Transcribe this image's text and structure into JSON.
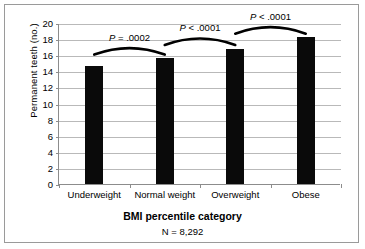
{
  "chart_data": {
    "type": "bar",
    "title": "",
    "xlabel": "BMI percentile category",
    "ylabel": "Permanent teeth (no.)",
    "subtitle": "N = 8,292",
    "categories": [
      "Underweight",
      "Normal weight",
      "Overweight",
      "Obese"
    ],
    "values": [
      14.7,
      15.7,
      16.8,
      18.3
    ],
    "ylim": [
      0,
      20
    ],
    "yticks": [
      0,
      2,
      4,
      6,
      8,
      10,
      12,
      14,
      16,
      18,
      20
    ],
    "ytick_labels": [
      "0",
      "2",
      "4",
      "6",
      "8",
      "10",
      "12",
      "14",
      "16",
      "18",
      "20"
    ],
    "grid": true,
    "legend": "none",
    "bar_color": "#0a0a0a",
    "annotations": [
      {
        "label": "P = .0002",
        "from": "Underweight",
        "to": "Normal weight",
        "arc_y": 16.2
      },
      {
        "label": "P < .0001",
        "from": "Normal weight",
        "to": "Overweight",
        "arc_y": 17.4
      },
      {
        "label": "P < .0001",
        "from": "Overweight",
        "to": "Obese",
        "arc_y": 18.8
      }
    ]
  }
}
